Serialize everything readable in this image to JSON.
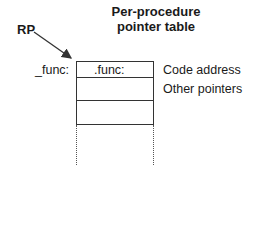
{
  "diagram": {
    "pointer_label": "RP",
    "title_line1": "Per-procedure",
    "title_line2": "pointer table",
    "entry_label": "_func:",
    "table": {
      "rows": [
        {
          "cell": ".func:",
          "annotation": "Code address"
        },
        {
          "cell": "",
          "annotation": "Other pointers"
        },
        {
          "cell": "",
          "annotation": ""
        }
      ],
      "continues": true
    }
  }
}
